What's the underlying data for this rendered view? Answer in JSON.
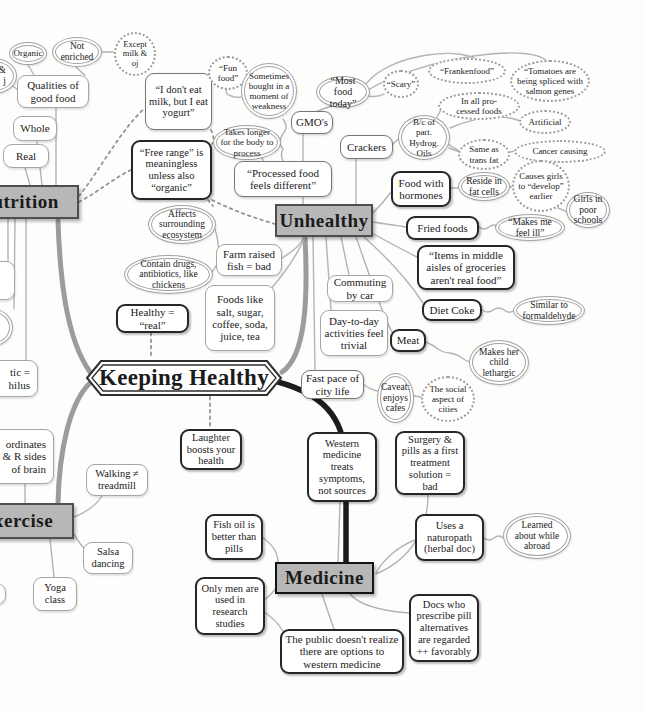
{
  "nodes": {
    "central": "Keeping Healthy",
    "nutrition": "Nutrition",
    "unhealthy": "Unhealthy",
    "exercise": "Exercise",
    "medicine": "Medicine",
    "organic": "Organic",
    "not_enriched": "Not enriched",
    "except_milk": "Except milk & oj",
    "edge_partial": "k &\nj",
    "qualities": "Qualities of good food",
    "whole": "Whole",
    "real": "Real",
    "i_dont_eat": "“I don't eat milk, but I eat yogurt”",
    "free_range": "“Free range” is meaningless unless also “organic”",
    "fun_food": "“Fun food”",
    "weakness": "Sometimes bought in a moment of weakness",
    "takes_longer": "Takes longer for the body to process",
    "most_food": "“Most food today”",
    "scary": "“Scary”",
    "frankenfood": "“Frankenfood”",
    "tomatoes": "“Tomatoes are being spliced with salmon genes",
    "in_all": "In all pro-\ncessed foods",
    "artificial": "Artificial",
    "bc_oils": "B/c of part. Hydrog. Oils",
    "same_trans": "Same as trans fat",
    "cancer": "Cancer causing",
    "gmos": "GMO's",
    "crackers": "Crackers",
    "processed": "“Processed food feels different”",
    "hormones": "Food with hormones",
    "reside": "Reside in fat cells",
    "causes_girls": "Causes girls to “develop” earlier",
    "girls_poor": "Girls in poor schools",
    "fried": "Fried foods",
    "makes_ill": "“Makes me feel ill”",
    "items": "“Items in middle aisles of groceries aren't real food”",
    "diet_coke": "Diet Coke",
    "formaldehyde": "Similar to formaldehyde",
    "meat": "Meat",
    "lethargic": "Makes her child lethargic",
    "commuting": "Commuting by car",
    "day_to_day": "Day-to-day activities feel trivial",
    "fast_pace": "Fast pace of city life",
    "caveat": "Caveat: enjoys cafes",
    "social": "The social aspect of cities",
    "ecosystem": "Affects surrounding ecosystem",
    "contain_drugs": "Contain drugs, antibiotics, like chickens",
    "farm_fish": "Farm raised fish = bad",
    "foods_like": "Foods like salt, sugar, coffee, soda, juice, tea",
    "healthy_real": "Healthy = “real”",
    "probiotic_partial": "tic =\nhilus",
    "coordinates_partial": "ordinates\n& R sides\nof brain",
    "walking": "Walking ≠ treadmill",
    "salsa": "Salsa dancing",
    "yoga": "Yoga class",
    "laughter": "Laughter boosts your health",
    "western": "Western medicine treats symptoms, not sources",
    "surgery": "Surgery & pills as a first treatment solution = bad",
    "fish_oil": "Fish oil is better than pills",
    "only_men": "Only men are used in research studies",
    "naturopath": "Uses a naturopath (herbal doc)",
    "learned": "Learned about while abroad",
    "docs": "Docs who prescribe pill alternatives are regarded ++ favorably",
    "public": "The public doesn't realize there are options to western medicine"
  },
  "colors": {
    "branch_line": "#9c9c9c",
    "medicine_line": "#1c1c1c",
    "header_fill": "#b7b7b7"
  }
}
